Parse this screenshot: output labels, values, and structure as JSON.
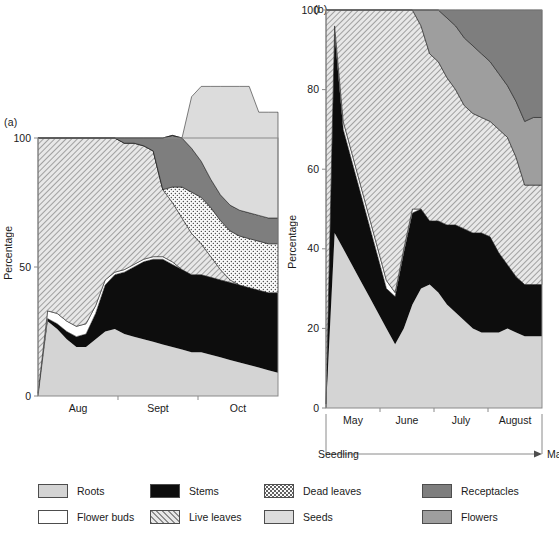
{
  "figure": {
    "panel_a_label": "(a)",
    "panel_b_label": "(b)",
    "y_axis_title": "Percentage"
  },
  "legend": {
    "columns": [
      {
        "items": [
          {
            "label": "Roots",
            "key": "roots",
            "fill": "#d4d4d4",
            "pattern": "solid"
          },
          {
            "label": "Flower buds",
            "key": "flower_buds",
            "fill": "#ffffff",
            "pattern": "solid"
          }
        ]
      },
      {
        "items": [
          {
            "label": "Stems",
            "key": "stems",
            "fill": "#0d0d0d",
            "pattern": "solid"
          },
          {
            "label": "Live leaves",
            "key": "live_leaves",
            "fill": "#e8e8e8",
            "pattern": "diagonal-hatch"
          }
        ]
      },
      {
        "items": [
          {
            "label": "Dead leaves",
            "key": "dead_leaves",
            "fill": "#fbfbfb",
            "pattern": "dots"
          },
          {
            "label": "Seeds",
            "key": "seeds",
            "fill": "#dcdcdc",
            "pattern": "solid"
          }
        ]
      },
      {
        "items": [
          {
            "label": "Receptacles",
            "key": "receptacles",
            "fill": "#7e7e7e",
            "pattern": "solid"
          },
          {
            "label": "Flowers",
            "key": "flowers",
            "fill": "#9e9e9e",
            "pattern": "solid"
          }
        ]
      }
    ]
  },
  "chart_data": [
    {
      "type": "area",
      "panel": "(a)",
      "title": "",
      "xlabel": "",
      "ylabel": "Percentage",
      "ylim": [
        0,
        100
      ],
      "yticks": [
        0,
        50,
        100
      ],
      "ytick_labels": [
        "0",
        "50",
        "100"
      ],
      "grid": false,
      "legend_position": "below-figure",
      "stacked": true,
      "categories": [
        "Aug",
        "Sept",
        "Oct"
      ],
      "category_tick_fractions": [
        0.0,
        0.3333,
        0.6667,
        1.0
      ],
      "x": [
        0,
        4,
        8,
        12,
        16,
        20,
        24,
        28,
        32,
        36,
        40,
        44,
        48,
        52,
        56,
        60,
        64,
        68,
        72,
        76,
        80,
        84,
        88,
        92,
        96,
        100
      ],
      "series": [
        {
          "name": "Roots",
          "key": "roots",
          "values": [
            0,
            29,
            26,
            22,
            19,
            19,
            22,
            25,
            26,
            24,
            23,
            22,
            21,
            20,
            19,
            18,
            17,
            17,
            16,
            15,
            14,
            13,
            12,
            11,
            10,
            9
          ]
        },
        {
          "name": "Stems",
          "key": "stems",
          "values": [
            0,
            1,
            2,
            3,
            4,
            5,
            10,
            18,
            21,
            24,
            27,
            30,
            32,
            33,
            32,
            31,
            30,
            30,
            30,
            30,
            30,
            30,
            30,
            30,
            30,
            31
          ]
        },
        {
          "name": "Flower buds",
          "key": "flower_buds",
          "values": [
            1,
            3,
            4,
            4,
            4,
            4,
            3,
            2,
            1,
            1,
            1,
            1,
            1,
            1,
            1,
            0,
            0,
            0,
            0,
            0,
            0,
            0,
            0,
            0,
            0,
            0
          ]
        },
        {
          "name": "Live leaves",
          "key": "live_leaves",
          "values": [
            99,
            67,
            68,
            71,
            73,
            72,
            65,
            55,
            52,
            49,
            47,
            44,
            41,
            26,
            23,
            20,
            16,
            12,
            8,
            4,
            1,
            0,
            0,
            0,
            0,
            0
          ]
        },
        {
          "name": "Dead leaves",
          "key": "dead_leaves",
          "values": [
            0,
            0,
            0,
            0,
            0,
            0,
            0,
            0,
            0,
            0,
            0,
            0,
            0,
            0,
            6,
            12,
            16,
            18,
            19,
            19,
            19,
            19,
            19,
            19,
            19,
            19
          ]
        },
        {
          "name": "Receptacles",
          "key": "receptacles",
          "values": [
            0,
            0,
            0,
            0,
            0,
            0,
            0,
            0,
            0,
            2,
            2,
            3,
            5,
            20,
            20,
            19,
            17,
            14,
            11,
            10,
            10,
            10,
            10,
            10,
            10,
            10
          ]
        },
        {
          "name": "Seeds",
          "key": "seeds",
          "values": [
            0,
            0,
            0,
            0,
            0,
            0,
            0,
            0,
            0,
            0,
            0,
            0,
            0,
            0,
            0,
            0,
            20,
            29,
            36,
            42,
            46,
            48,
            49,
            40,
            41,
            41
          ]
        }
      ],
      "notes": "Stacked from bottom: Roots, Stems, Flower buds, Live leaves, Dead leaves, Receptacles, Seeds. Total 100%."
    },
    {
      "type": "area",
      "panel": "(b)",
      "title": "",
      "xlabel": "",
      "ylabel": "Percentage",
      "ylim": [
        0,
        100
      ],
      "yticks": [
        0,
        20,
        40,
        60,
        80,
        100
      ],
      "ytick_labels": [
        "0",
        "20",
        "40",
        "60",
        "80",
        "100"
      ],
      "grid": false,
      "legend_position": "below-figure",
      "stacked": true,
      "categories": [
        "May",
        "June",
        "July",
        "August"
      ],
      "category_tick_fractions": [
        0.0,
        0.25,
        0.5,
        0.75,
        1.0
      ],
      "stage_axis": {
        "start_label": "Seedling",
        "end_label": "Mature"
      },
      "x": [
        0,
        4,
        8,
        12,
        16,
        20,
        24,
        28,
        32,
        36,
        40,
        44,
        48,
        52,
        56,
        60,
        64,
        68,
        72,
        76,
        80,
        84,
        88,
        92,
        96,
        100
      ],
      "series": [
        {
          "name": "Roots",
          "key": "roots",
          "values": [
            0,
            44,
            40,
            36,
            32,
            28,
            24,
            20,
            16,
            20,
            26,
            30,
            31,
            29,
            26,
            24,
            22,
            20,
            19,
            19,
            19,
            20,
            19,
            18,
            18,
            18
          ]
        },
        {
          "name": "Stems",
          "key": "stems",
          "values": [
            0,
            50,
            30,
            26,
            22,
            18,
            14,
            10,
            12,
            19,
            23,
            20,
            16,
            18,
            20,
            22,
            23,
            24,
            25,
            24,
            20,
            16,
            14,
            13,
            13,
            13
          ]
        },
        {
          "name": "Flower buds",
          "key": "flower_buds",
          "values": [
            1,
            2,
            2,
            2,
            2,
            2,
            2,
            2,
            1,
            1,
            1,
            0,
            0,
            0,
            0,
            0,
            0,
            0,
            0,
            0,
            0,
            0,
            0,
            0,
            0,
            0
          ]
        },
        {
          "name": "Live leaves",
          "key": "live_leaves",
          "values": [
            99,
            4,
            28,
            36,
            44,
            52,
            60,
            68,
            71,
            60,
            50,
            46,
            42,
            40,
            37,
            34,
            31,
            30,
            29,
            29,
            31,
            32,
            30,
            25,
            25,
            25
          ]
        },
        {
          "name": "Flowers",
          "key": "flowers",
          "values": [
            0,
            0,
            0,
            0,
            0,
            0,
            0,
            0,
            0,
            0,
            0,
            4,
            11,
            13,
            15,
            16,
            17,
            17,
            16,
            15,
            14,
            13,
            14,
            16,
            17,
            17
          ]
        },
        {
          "name": "Receptacles",
          "key": "receptacles",
          "values": [
            0,
            0,
            0,
            0,
            0,
            0,
            0,
            0,
            0,
            0,
            0,
            0,
            0,
            0,
            2,
            4,
            7,
            9,
            11,
            13,
            16,
            19,
            23,
            28,
            27,
            27
          ]
        },
        {
          "name": "Seeds",
          "key": "seeds",
          "values": [
            0,
            0,
            0,
            0,
            0,
            0,
            0,
            0,
            0,
            0,
            0,
            0,
            0,
            0,
            0,
            0,
            0,
            0,
            0,
            0,
            0,
            0,
            0,
            0,
            0,
            0
          ]
        }
      ],
      "notes": "Stacked from bottom: Roots, Stems, Flower buds, Live leaves, Flowers, Receptacles, Seeds. Total 100%. Deep V dip in early June."
    }
  ]
}
